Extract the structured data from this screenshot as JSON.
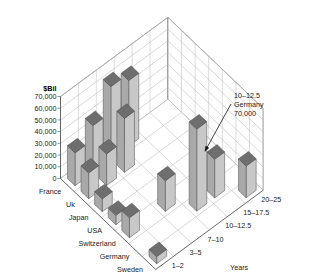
{
  "chart_data": {
    "type": "bar",
    "render": "3d-bar",
    "title": "",
    "zlabel": "$Bil",
    "ylabel": "Years",
    "xlabel": "",
    "grid": true,
    "legend": "none",
    "zlim": [
      0,
      70000
    ],
    "zticks": [
      "0",
      "10,000",
      "20,000",
      "30,000",
      "40,000",
      "50,000",
      "60,000",
      "70,000"
    ],
    "ztick_values": [
      0,
      10000,
      20000,
      30000,
      40000,
      50000,
      60000,
      70000
    ],
    "categories_x": [
      "France",
      "Uk",
      "Japan",
      "USA",
      "Switzerland",
      "Germany",
      "Sweden"
    ],
    "categories_y": [
      "1–2",
      "3–5",
      "7–10",
      "10–12.5",
      "15–17.5",
      "20–25"
    ],
    "series": [
      {
        "name": "1–2",
        "values": [
          28000,
          22000,
          11000,
          8000,
          17000,
          0,
          6000
        ]
      },
      {
        "name": "3–5",
        "values": [
          40000,
          27000,
          0,
          0,
          0,
          0,
          0
        ]
      },
      {
        "name": "7–10",
        "values": [
          62000,
          46000,
          0,
          0,
          26000,
          0,
          0
        ]
      },
      {
        "name": "10–12.5",
        "values": [
          56000,
          0,
          0,
          0,
          0,
          70000,
          0
        ]
      },
      {
        "name": "15–17.5",
        "values": [
          0,
          0,
          0,
          0,
          0,
          33000,
          0
        ]
      },
      {
        "name": "20–25",
        "values": [
          0,
          0,
          0,
          0,
          0,
          0,
          27000
        ]
      }
    ],
    "annotation": {
      "line1": "10–12.5",
      "line2": "Germany",
      "line3": "70,000"
    },
    "colors": {
      "bar_front": "#a9a9a9",
      "bar_side": "#c8c8c8",
      "bar_top": "#6e6e6e",
      "bar_edge": "#4a4a4a",
      "grid": "#b9b9b9",
      "axis": "#555555",
      "text": "#1a1a1a",
      "background": "#ffffff"
    }
  }
}
